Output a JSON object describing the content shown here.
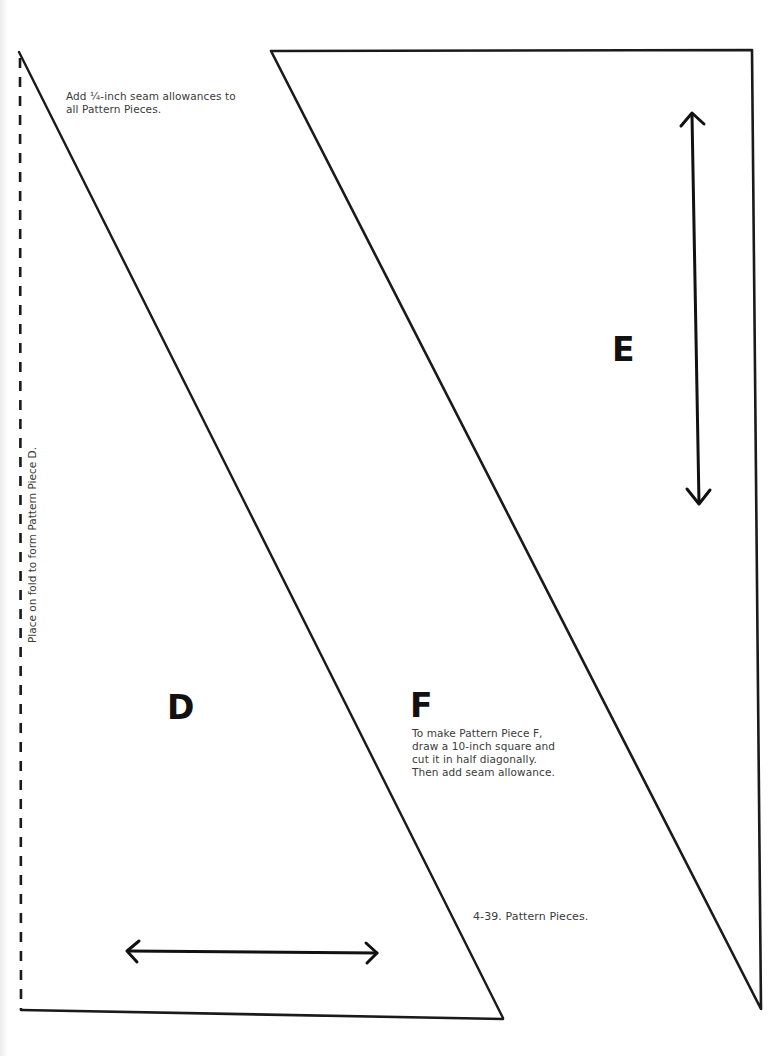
{
  "page": {
    "seam_note": [
      "Add ¼-inch seam allowances to",
      "all Pattern Pieces."
    ],
    "fold_label": "Place on fold to form Pattern Piece D.",
    "pieces": {
      "d": {
        "letter": "D"
      },
      "e": {
        "letter": "E"
      },
      "f": {
        "letter": "F",
        "instructions": [
          "To make Pattern Piece F,",
          "draw a 10-inch square and",
          "cut it in half diagonally.",
          "Then add seam allowance."
        ]
      }
    },
    "caption": "4-39. Pattern Pieces."
  },
  "colors": {
    "line": "#1a1a1a",
    "text": "#3a3a3a",
    "paper": "#ffffff"
  }
}
